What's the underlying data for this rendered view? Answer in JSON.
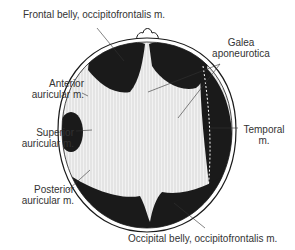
{
  "diagram": {
    "colors": {
      "ink": "#1a1a1a",
      "label": "#333333",
      "background": "#ffffff",
      "aponeurosis": "#f2f2f2"
    },
    "labels": {
      "frontal_belly": "Frontal belly, occipitofrontalis m.",
      "galea_line1": "Galea",
      "galea_line2": "aponeurotica",
      "anterior_line1": "Anterior",
      "anterior_line2": "auricular m.",
      "superior_line1": "Superior",
      "superior_line2": "auricular m.",
      "temporal_line1": "Temporal",
      "temporal_line2": "m.",
      "posterior_line1": "Posterior",
      "posterior_line2": "auricular m.",
      "occipital_belly": "Occipital belly, occipitofrontalis m."
    }
  }
}
